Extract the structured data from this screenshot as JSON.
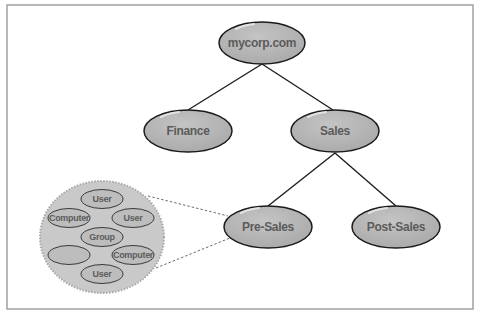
{
  "diagram": {
    "type": "tree",
    "title": "",
    "nodes": [
      {
        "id": "root",
        "label": "mycorp.com",
        "parent": null
      },
      {
        "id": "finance",
        "label": "Finance",
        "parent": "root"
      },
      {
        "id": "sales",
        "label": "Sales",
        "parent": "root"
      },
      {
        "id": "presales",
        "label": "Pre-Sales",
        "parent": "sales"
      },
      {
        "id": "postsales",
        "label": "Post-Sales",
        "parent": "sales"
      }
    ],
    "edges": [
      {
        "from": "root",
        "to": "finance"
      },
      {
        "from": "root",
        "to": "sales"
      },
      {
        "from": "sales",
        "to": "presales"
      },
      {
        "from": "sales",
        "to": "postsales"
      }
    ],
    "detail": {
      "expands": "presales",
      "objects": [
        {
          "label": "User"
        },
        {
          "label": "Computer"
        },
        {
          "label": "User"
        },
        {
          "label": "Group"
        },
        {
          "label": ""
        },
        {
          "label": "Computer"
        },
        {
          "label": "User"
        }
      ]
    }
  },
  "colors": {
    "node_fill": "#b3b3b3",
    "node_stroke": "#1a1a1a",
    "label_text": "#5b5b5b",
    "detail_circle": "#c9c9c9",
    "frame_border": "#9a9a9a"
  }
}
